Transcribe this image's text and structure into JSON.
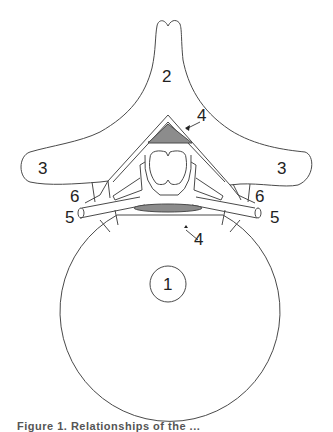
{
  "figure": {
    "type": "anatomical-diagram",
    "stroke_color": "#4a4a4a",
    "fill_shaded": "#8c8c8c",
    "labels": {
      "vertebral_body": "1",
      "spinous_process": "2",
      "transverse_process_left": "3",
      "transverse_process_right": "3",
      "shaded_region_posterior": "4",
      "shaded_region_anterior": "4",
      "nerve_root_left": "5",
      "nerve_root_right": "5",
      "facet_left": "6",
      "facet_right": "6"
    },
    "caption": "Figure 1. Relationships of the ..."
  }
}
